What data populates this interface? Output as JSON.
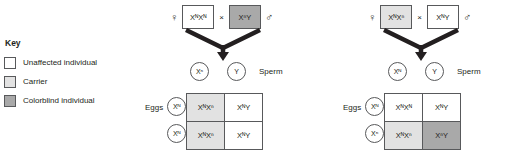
{
  "key": {
    "title": "Key",
    "items": [
      {
        "label": "Unaffected individual",
        "swatch": "white",
        "color": "#ffffff"
      },
      {
        "label": "Carrier",
        "swatch": "light",
        "color": "#e2e2e2"
      },
      {
        "label": "Colorblind individual",
        "swatch": "dark",
        "color": "#a9a9a9"
      }
    ]
  },
  "symbols": {
    "female": "♀",
    "male": "♂",
    "cross": "×"
  },
  "crosses": [
    {
      "id": "cross-1",
      "mother": {
        "genotype": "XᴺXᴺ",
        "status": "white",
        "sex": "female"
      },
      "father": {
        "genotype": "XⁿY",
        "status": "dark",
        "sex": "male"
      },
      "sperm_label": "Sperm",
      "eggs_label": "Eggs",
      "sperm": [
        "Xⁿ",
        "Y"
      ],
      "eggs": [
        "Xᴺ",
        "Xᴺ"
      ],
      "offspring": [
        [
          {
            "genotype": "XᴺXⁿ",
            "status": "light"
          },
          {
            "genotype": "XᴺY",
            "status": "white"
          }
        ],
        [
          {
            "genotype": "XᴺXⁿ",
            "status": "light"
          },
          {
            "genotype": "XᴺY",
            "status": "white"
          }
        ]
      ]
    },
    {
      "id": "cross-2",
      "mother": {
        "genotype": "XᴺXⁿ",
        "status": "light",
        "sex": "female"
      },
      "father": {
        "genotype": "XᴺY",
        "status": "white",
        "sex": "male"
      },
      "sperm_label": "Sperm",
      "eggs_label": "Eggs",
      "sperm": [
        "Xᴺ",
        "Y"
      ],
      "eggs": [
        "Xᴺ",
        "Xⁿ"
      ],
      "offspring": [
        [
          {
            "genotype": "XᴺXᴺ",
            "status": "white"
          },
          {
            "genotype": "XᴺY",
            "status": "white"
          }
        ],
        [
          {
            "genotype": "XᴺXⁿ",
            "status": "light"
          },
          {
            "genotype": "XⁿY",
            "status": "dark"
          }
        ]
      ]
    }
  ]
}
